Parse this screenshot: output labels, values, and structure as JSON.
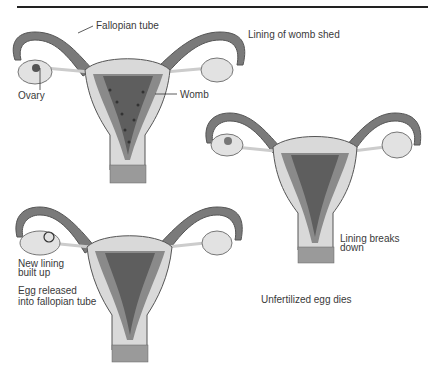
{
  "diagram": {
    "title_rule": true,
    "colors": {
      "outline": "#555555",
      "wall": "#d9d9d9",
      "lining": "#8a8a8a",
      "cavity": "#5e5e5e",
      "tube": "#7a7a7a",
      "ovary": "#e2e2e2",
      "cervix": "#9a9a9a"
    },
    "figures": [
      {
        "id": "top-left",
        "stage": "menstruation",
        "labels": {
          "fallopian_tube": "Fallopian tube",
          "ovary": "Ovary",
          "womb": "Womb",
          "caption": "Lining of womb shed"
        }
      },
      {
        "id": "right",
        "stage": "lining-breakdown",
        "labels": {
          "caption": "Lining breaks\ndown",
          "caption_line1": "Lining breaks",
          "caption_line2": "down",
          "secondary": "Unfertilized egg dies"
        }
      },
      {
        "id": "bottom-left",
        "stage": "ovulation",
        "labels": {
          "caption_line1": "New lining",
          "caption_line2": "built up",
          "egg_line1": "Egg released",
          "egg_line2": "into fallopian tube"
        }
      }
    ]
  }
}
